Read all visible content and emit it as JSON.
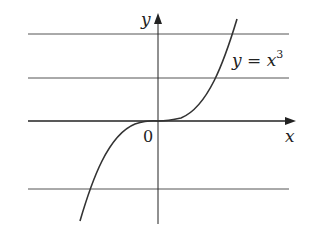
{
  "diagram": {
    "function_label": "y = x³",
    "function_label_parts": {
      "lhs": "y",
      "eq": " = ",
      "base": "x",
      "exp": "3"
    },
    "x_axis_label": "x",
    "y_axis_label": "y",
    "origin_label": "0",
    "horizontal_lines_count": 3,
    "colors": {
      "curve": "#333333",
      "axes": "#222222",
      "lines": "#555555",
      "background": "#ffffff"
    }
  }
}
